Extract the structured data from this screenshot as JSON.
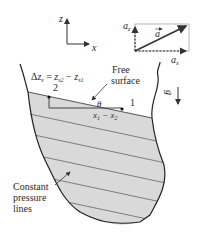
{
  "diagram": {
    "axes": {
      "z_label": "z",
      "x_label": "x"
    },
    "acceleration": {
      "vector_label": "a",
      "az_label": "a",
      "az_sub": "z",
      "ax_label": "a",
      "ax_sub": "x"
    },
    "gravity": {
      "label": "g"
    },
    "delta_z": {
      "delta": "Δ",
      "z": "z",
      "s": "s",
      "eq": " = ",
      "z2": "z",
      "s2": "s2",
      "minus": " − ",
      "z1": "z",
      "s1": "s1"
    },
    "free_surface": {
      "line1": "Free",
      "line2": "surface"
    },
    "points": {
      "p1": "1",
      "p2": "2"
    },
    "angle": {
      "theta": "θ"
    },
    "horizontal_distance": {
      "x1": "x",
      "s1": "1",
      "minus": " − ",
      "x2": "x",
      "s2": "2"
    },
    "pressure_lines_label": {
      "line1": "Constant",
      "line2": "pressure",
      "line3": "lines"
    },
    "colors": {
      "fluid_fill": "#d9d9d9",
      "line": "#333333",
      "text": "#2a2a2a"
    }
  }
}
